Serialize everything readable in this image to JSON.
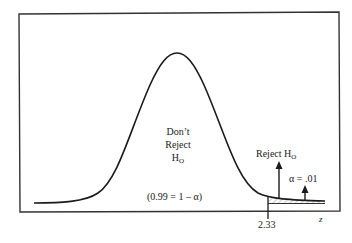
{
  "diagram": {
    "type": "normal-distribution-one-tailed-test",
    "region_center": {
      "line1": "Don’t",
      "line2": "Reject",
      "line3": "H",
      "line3_sub": "O"
    },
    "confidence_label": "(0.99 = 1 – α)",
    "reject_label": "Reject H",
    "reject_label_sub": "O",
    "alpha_label": "α = .01",
    "critical_value": "2.33",
    "axis_label": "z",
    "colors": {
      "line": "#1a1a1a",
      "hatch": "#999999",
      "background": "#ffffff"
    }
  }
}
